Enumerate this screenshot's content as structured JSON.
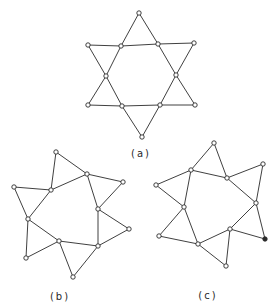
{
  "figure": {
    "panels": [
      {
        "id": "a",
        "label": "(a)",
        "label_pos": [
          141,
          157
        ],
        "nodes": [
          [
            139,
            13
          ],
          [
            88,
            45
          ],
          [
            121,
            46
          ],
          [
            158,
            44
          ],
          [
            194,
            43
          ],
          [
            106,
            76
          ],
          [
            176,
            75
          ],
          [
            88,
            105
          ],
          [
            122,
            106
          ],
          [
            160,
            105
          ],
          [
            195,
            105
          ],
          [
            142,
            137
          ]
        ],
        "filled_nodes": [],
        "edges": [
          [
            0,
            2
          ],
          [
            0,
            3
          ],
          [
            1,
            2
          ],
          [
            2,
            3
          ],
          [
            3,
            4
          ],
          [
            1,
            5
          ],
          [
            2,
            5
          ],
          [
            3,
            6
          ],
          [
            4,
            6
          ],
          [
            5,
            7
          ],
          [
            5,
            8
          ],
          [
            6,
            9
          ],
          [
            6,
            10
          ],
          [
            7,
            8
          ],
          [
            8,
            9
          ],
          [
            9,
            10
          ],
          [
            8,
            11
          ],
          [
            9,
            11
          ]
        ]
      },
      {
        "id": "b",
        "label": "(b)",
        "label_pos": [
          60,
          300
        ],
        "nodes": [
          [
            56,
            152
          ],
          [
            87,
            174
          ],
          [
            123,
            182
          ],
          [
            14,
            187
          ],
          [
            51,
            190
          ],
          [
            98,
            209
          ],
          [
            28,
            219
          ],
          [
            129,
            229
          ],
          [
            59,
            241
          ],
          [
            98,
            246
          ],
          [
            26,
            258
          ],
          [
            73,
            277
          ]
        ],
        "filled_nodes": [],
        "edges": [
          [
            0,
            4
          ],
          [
            0,
            1
          ],
          [
            4,
            1
          ],
          [
            1,
            2
          ],
          [
            2,
            5
          ],
          [
            1,
            5
          ],
          [
            3,
            4
          ],
          [
            3,
            6
          ],
          [
            4,
            6
          ],
          [
            5,
            7
          ],
          [
            7,
            9
          ],
          [
            5,
            9
          ],
          [
            6,
            8
          ],
          [
            6,
            10
          ],
          [
            10,
            8
          ],
          [
            8,
            9
          ],
          [
            8,
            11
          ],
          [
            9,
            11
          ]
        ]
      },
      {
        "id": "c",
        "label": "(c)",
        "label_pos": [
          208,
          299
        ],
        "nodes": [
          [
            214,
            143
          ],
          [
            191,
            170
          ],
          [
            227,
            178
          ],
          [
            263,
            164
          ],
          [
            156,
            185
          ],
          [
            184,
            207
          ],
          [
            256,
            203
          ],
          [
            230,
            229
          ],
          [
            159,
            236
          ],
          [
            265,
            239
          ],
          [
            198,
            244
          ],
          [
            226,
            266
          ]
        ],
        "filled_nodes": [
          9
        ],
        "edges": [
          [
            0,
            1
          ],
          [
            0,
            2
          ],
          [
            1,
            2
          ],
          [
            2,
            3
          ],
          [
            3,
            6
          ],
          [
            2,
            6
          ],
          [
            4,
            1
          ],
          [
            4,
            5
          ],
          [
            1,
            5
          ],
          [
            6,
            7
          ],
          [
            6,
            9
          ],
          [
            7,
            9
          ],
          [
            7,
            10
          ],
          [
            7,
            11
          ],
          [
            10,
            11
          ],
          [
            5,
            10
          ],
          [
            5,
            8
          ],
          [
            8,
            10
          ]
        ]
      }
    ]
  }
}
